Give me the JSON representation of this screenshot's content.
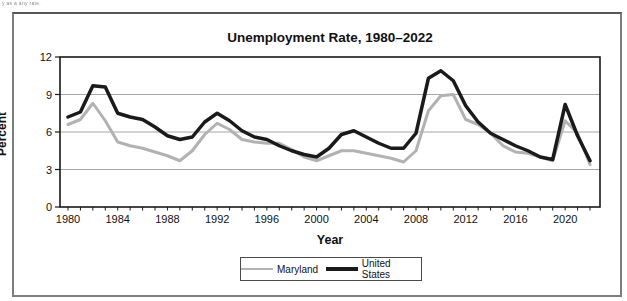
{
  "page": {
    "corner_note": "y as a any rate."
  },
  "chart": {
    "title": "Unemployment Rate, 1980–2022",
    "y_axis_title": "Percent",
    "x_axis_title": "Year"
  },
  "legend": {
    "items": [
      {
        "label": "Maryland"
      },
      {
        "label": "United States"
      }
    ]
  },
  "chart_data": {
    "type": "line",
    "title": "Unemployment Rate, 1980–2022",
    "xlabel": "Year",
    "ylabel": "Percent",
    "ylim": [
      0,
      12
    ],
    "y_ticks": [
      0,
      3,
      6,
      9,
      12
    ],
    "x_range": [
      1980,
      2022
    ],
    "x_tick_labels": [
      "1980",
      "1984",
      "1988",
      "1992",
      "1996",
      "2000",
      "2004",
      "2008",
      "2012",
      "2016",
      "2020"
    ],
    "grid": "horizontal",
    "legend_position": "bottom-center",
    "x": [
      1980,
      1981,
      1982,
      1983,
      1984,
      1985,
      1986,
      1987,
      1988,
      1989,
      1990,
      1991,
      1992,
      1993,
      1994,
      1995,
      1996,
      1997,
      1998,
      1999,
      2000,
      2001,
      2002,
      2003,
      2004,
      2005,
      2006,
      2007,
      2008,
      2009,
      2010,
      2011,
      2012,
      2013,
      2014,
      2015,
      2016,
      2017,
      2018,
      2019,
      2020,
      2021,
      2022
    ],
    "series": [
      {
        "name": "Maryland",
        "color": "#b2b2b2",
        "stroke_width": 3,
        "values": [
          6.6,
          7.0,
          8.3,
          6.9,
          5.2,
          4.9,
          4.7,
          4.4,
          4.1,
          3.7,
          4.5,
          5.8,
          6.7,
          6.2,
          5.4,
          5.2,
          5.1,
          5.1,
          4.6,
          4.0,
          3.7,
          4.1,
          4.5,
          4.5,
          4.3,
          4.1,
          3.9,
          3.6,
          4.5,
          7.7,
          8.9,
          9.0,
          7.0,
          6.6,
          5.9,
          4.9,
          4.4,
          4.3,
          4.0,
          3.7,
          6.9,
          5.9,
          3.4
        ]
      },
      {
        "name": "United States",
        "color": "#1a1a1a",
        "stroke_width": 3.5,
        "values": [
          7.2,
          7.6,
          9.7,
          9.6,
          7.5,
          7.2,
          7.0,
          6.4,
          5.7,
          5.4,
          5.6,
          6.8,
          7.5,
          6.9,
          6.1,
          5.6,
          5.4,
          4.9,
          4.5,
          4.2,
          4.0,
          4.7,
          5.8,
          6.1,
          5.6,
          5.1,
          4.7,
          4.7,
          5.9,
          10.3,
          10.9,
          10.1,
          8.1,
          6.8,
          5.9,
          5.4,
          4.9,
          4.5,
          4.0,
          3.8,
          8.2,
          5.7,
          3.7
        ]
      }
    ],
    "axis_color": "#1a1a1a",
    "grid_color": "#a6a6a6"
  }
}
